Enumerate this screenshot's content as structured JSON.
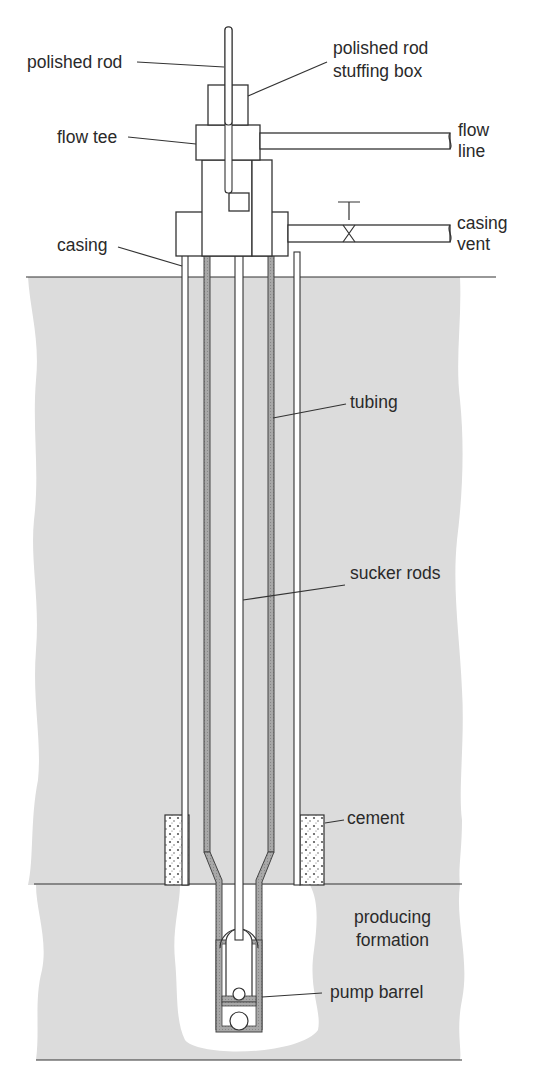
{
  "diagram": {
    "colors": {
      "ground": "#dcdcdc",
      "tubing_wall": "#9a9a9a",
      "line": "#333333",
      "background": "#ffffff"
    },
    "labels": {
      "polished_rod": "polished rod",
      "stuffing_box_1": "polished rod",
      "stuffing_box_2": "stuffing box",
      "flow_tee": "flow tee",
      "flow_line_1": "flow",
      "flow_line_2": "line",
      "casing": "casing",
      "casing_vent_1": "casing",
      "casing_vent_2": "vent",
      "tubing": "tubing",
      "sucker_rods": "sucker rods",
      "cement": "cement",
      "producing_formation_1": "producing",
      "producing_formation_2": "formation",
      "pump_barrel": "pump barrel"
    }
  }
}
